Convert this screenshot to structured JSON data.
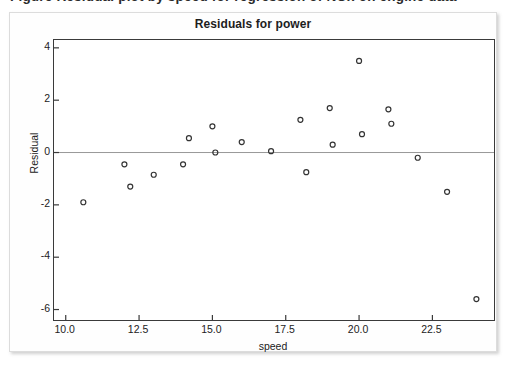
{
  "caption": {
    "text": "Figure  Residual plot by speed for regression of NOx on engine data"
  },
  "chart_data": {
    "type": "scatter",
    "title": "Residuals for power",
    "xlabel": "speed",
    "ylabel": "Residual",
    "xlim": [
      9.6,
      24.6
    ],
    "ylim": [
      -6.4,
      4.3
    ],
    "xticks": [
      "10.0",
      "12.5",
      "15.0",
      "17.5",
      "20.0",
      "22.5"
    ],
    "xtick_values": [
      10.0,
      12.5,
      15.0,
      17.5,
      20.0,
      22.5
    ],
    "yticks": [
      "4",
      "2",
      "0",
      "-2",
      "-4",
      "-6"
    ],
    "ytick_values": [
      4,
      2,
      0,
      -2,
      -4,
      -6
    ],
    "grid": false,
    "legend": false,
    "reference_line": {
      "y": 0,
      "color": "#999999"
    },
    "marker": {
      "shape": "open-circle",
      "size": 5,
      "edge_color": "#333333",
      "fill_color": "none"
    },
    "x": [
      10.6,
      12.0,
      12.2,
      13.0,
      14.0,
      14.2,
      15.0,
      15.1,
      16.0,
      17.0,
      18.0,
      18.2,
      19.0,
      19.1,
      20.0,
      20.1,
      21.0,
      21.1,
      22.0,
      23.0,
      24.0
    ],
    "y": [
      -1.9,
      -0.45,
      -1.3,
      -0.85,
      -0.45,
      0.55,
      1.0,
      0.0,
      0.4,
      0.05,
      1.25,
      -0.75,
      1.7,
      0.3,
      3.5,
      0.7,
      1.65,
      1.1,
      -0.2,
      -1.5,
      -5.6
    ],
    "points": [
      {
        "x": 10.6,
        "y": -1.9
      },
      {
        "x": 12.0,
        "y": -0.45
      },
      {
        "x": 12.2,
        "y": -1.3
      },
      {
        "x": 13.0,
        "y": -0.85
      },
      {
        "x": 14.0,
        "y": -0.45
      },
      {
        "x": 14.2,
        "y": 0.55
      },
      {
        "x": 15.0,
        "y": 1.0
      },
      {
        "x": 15.1,
        "y": 0.0
      },
      {
        "x": 16.0,
        "y": 0.4
      },
      {
        "x": 17.0,
        "y": 0.05
      },
      {
        "x": 18.0,
        "y": 1.25
      },
      {
        "x": 18.2,
        "y": -0.75
      },
      {
        "x": 19.0,
        "y": 1.7
      },
      {
        "x": 19.1,
        "y": 0.3
      },
      {
        "x": 20.0,
        "y": 3.5
      },
      {
        "x": 20.1,
        "y": 0.7
      },
      {
        "x": 21.0,
        "y": 1.65
      },
      {
        "x": 21.1,
        "y": 1.1
      },
      {
        "x": 22.0,
        "y": -0.2
      },
      {
        "x": 23.0,
        "y": -1.5
      },
      {
        "x": 24.0,
        "y": -5.6
      }
    ]
  }
}
